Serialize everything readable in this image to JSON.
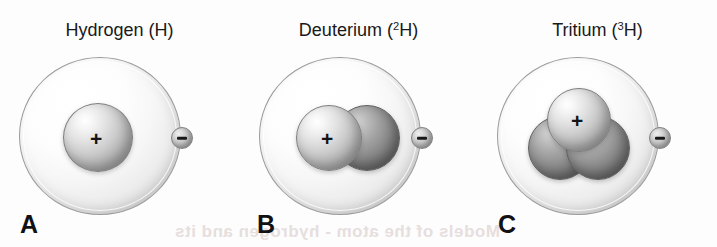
{
  "figure": {
    "background_color": "#fdfdfd",
    "bleed_through_text": "Models of the atom - hydrogen and its"
  },
  "panels": [
    {
      "letter": "A",
      "title_name": "Hydrogen",
      "title_symbol_prefix": "(",
      "mass_number": "",
      "element_symbol": "H",
      "title_symbol_suffix": ")",
      "title_full": "Hydrogen (H)",
      "protons": 1,
      "neutrons": 0,
      "electrons": 1,
      "proton_charge_label": "+",
      "electron_charge_label": "−"
    },
    {
      "letter": "B",
      "title_name": "Deuterium",
      "title_symbol_prefix": "(",
      "mass_number": "2",
      "element_symbol": "H",
      "title_symbol_suffix": ")",
      "title_full": "Deuterium (2H)",
      "protons": 1,
      "neutrons": 1,
      "electrons": 1,
      "proton_charge_label": "+",
      "electron_charge_label": "−"
    },
    {
      "letter": "C",
      "title_name": "Tritium",
      "title_symbol_prefix": "(",
      "mass_number": "3",
      "element_symbol": "H",
      "title_symbol_suffix": ")",
      "title_full": "Tritium (3H)",
      "protons": 1,
      "neutrons": 2,
      "electrons": 1,
      "proton_charge_label": "+",
      "electron_charge_label": "−"
    }
  ],
  "colors": {
    "proton_light": "#e2e2e2",
    "neutron_dark": "#8b8b8b",
    "orbit_shell": "#f2f2f2",
    "electron": "#c4c4c4",
    "text": "#19191a"
  }
}
